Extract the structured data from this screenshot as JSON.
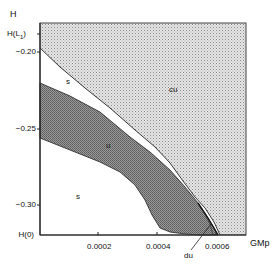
{
  "diagram": {
    "y_axis_label": "H",
    "x_axis_label": "GMp",
    "y_ticks": [
      {
        "label": "H(L",
        "sub": "1",
        "close": ")",
        "y": 34
      },
      {
        "label": "−0.20",
        "y": 52
      },
      {
        "label": "−0.25",
        "y": 129
      },
      {
        "label": "−0.30",
        "y": 205
      },
      {
        "label": "H(0)",
        "y": 235
      }
    ],
    "x_ticks": [
      {
        "label": "0.0002",
        "x": 98
      },
      {
        "label": "0.0004",
        "x": 157
      },
      {
        "label": "0.0006",
        "x": 216
      }
    ],
    "regions": {
      "cu": "cu",
      "s_upper": "s",
      "u": "u",
      "s_lower": "s",
      "du": "du"
    },
    "colors": {
      "cu_fill": "#d4d4d4",
      "u_fill": "#8e8e8e",
      "stable_fill": "#ffffff",
      "line": "#222222"
    }
  }
}
